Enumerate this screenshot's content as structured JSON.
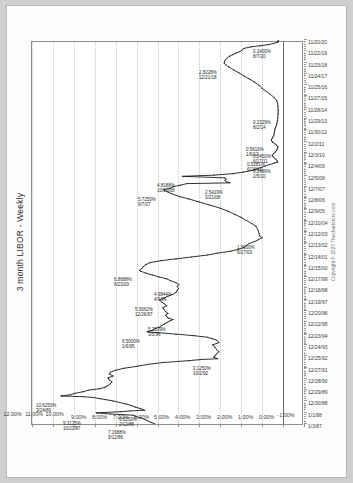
{
  "document": {
    "background_color": "#cfcfcf",
    "sheet_color": "#fdfdfd"
  },
  "chart_data": {
    "type": "line",
    "title": "3 month LIBOR - Weekly",
    "xlabel": "",
    "ylabel": "",
    "ylim": [
      -1.0,
      12.0
    ],
    "y_tick_step": 1.0,
    "grid": true,
    "legend": "none",
    "rotation_degrees": -90,
    "line_color": "#1a1a1a",
    "ytick_labels": [
      "12.00%",
      "11.00%",
      "10.00%",
      "9.00%",
      "8.00%",
      "7.00%",
      "6.00%",
      "5.00%",
      "4.00%",
      "3.00%",
      "2.00%",
      "1.00%",
      "0.00%",
      "-1.00%"
    ],
    "ytick_values": [
      12,
      11,
      10,
      9,
      8,
      7,
      6,
      5,
      4,
      3,
      2,
      1,
      0,
      -1
    ],
    "xtick_labels": [
      "1/3/87",
      "1/1/88",
      "12/30/88",
      "12/29/89",
      "12/28/90",
      "12/27/91",
      "12/25/92",
      "12/24/93",
      "12/23/94",
      "12/22/95",
      "12/20/96",
      "12/19/97",
      "12/18/98",
      "12/17/99",
      "12/15/00",
      "12/14/01",
      "12/13/02",
      "12/12/03",
      "12/10/04",
      "12/9/05",
      "12/8/06",
      "12/7/07",
      "12/5/08",
      "12/4/09",
      "12/3/10",
      "12/2/11",
      "11/30/12",
      "11/29/13",
      "11/28/14",
      "11/27/15",
      "11/25/16",
      "11/24/17",
      "11/23/18",
      "11/22/19",
      "11/20/20"
    ],
    "annotations": [
      {
        "date": "3/24/89",
        "value": "10.6250%",
        "x": 0.073,
        "y": 10.625
      },
      {
        "date": "10/23/87",
        "value": "9.3125%",
        "x": 0.025,
        "y": 9.3125
      },
      {
        "date": "9/12/86",
        "value": "7.1688%",
        "x": 0.003,
        "y": 7.1688
      },
      {
        "date": "2/12/88",
        "value": "6.6250%",
        "x": 0.036,
        "y": 6.625
      },
      {
        "date": "10/2/92",
        "value": "3.1250%",
        "x": 0.17,
        "y": 3.125
      },
      {
        "date": "1/6/95",
        "value": "6.5000%",
        "x": 0.24,
        "y": 6.5
      },
      {
        "date": "3/5/96",
        "value": "5.2539%",
        "x": 0.272,
        "y": 5.2539
      },
      {
        "date": "12/26/97",
        "value": "5.9062%",
        "x": 0.323,
        "y": 5.9062
      },
      {
        "date": "4/9/99",
        "value": "4.9844%",
        "x": 0.363,
        "y": 4.9844
      },
      {
        "date": "6/23/00",
        "value": "6.8688%",
        "x": 0.4,
        "y": 6.8688
      },
      {
        "date": "6/27/03",
        "value": "1.0000%",
        "x": 0.485,
        "y": 1.0
      },
      {
        "date": "9/7/07",
        "value": "5.7250%",
        "x": 0.61,
        "y": 5.725
      },
      {
        "date": "10/10/08",
        "value": "4.8188%",
        "x": 0.645,
        "y": 4.8188
      },
      {
        "date": "3/21/08",
        "value": "2.5419%",
        "x": 0.628,
        "y": 2.5419
      },
      {
        "date": "2/5/10",
        "value": "0.2486%",
        "x": 0.682,
        "y": 0.2486
      },
      {
        "date": "6/17/11",
        "value": "0.2450%",
        "x": 0.722,
        "y": 0.245
      },
      {
        "date": "1/6/12",
        "value": "0.5616%",
        "x": 0.74,
        "y": 0.5616
      },
      {
        "date": "6/18/10",
        "value": "0.5281%",
        "x": 0.7,
        "y": 0.5281
      },
      {
        "date": "8/2/14",
        "value": "0.2329%",
        "x": 0.81,
        "y": 0.2329
      },
      {
        "date": "12/21/18",
        "value": "2.8228%",
        "x": 0.94,
        "y": 2.8228
      },
      {
        "date": "8/7/20",
        "value": "0.2400%",
        "x": 0.995,
        "y": 0.24
      }
    ],
    "series": [
      {
        "name": "3 month LIBOR",
        "points": [
          [
            0.0,
            6.12
          ],
          [
            0.004,
            6.31
          ],
          [
            0.009,
            6.5
          ],
          [
            0.012,
            6.62
          ],
          [
            0.016,
            6.81
          ],
          [
            0.02,
            7.06
          ],
          [
            0.023,
            7.17
          ],
          [
            0.026,
            8.25
          ],
          [
            0.029,
            8.93
          ],
          [
            0.032,
            7.75
          ],
          [
            0.034,
            7.31
          ],
          [
            0.036,
            6.62
          ],
          [
            0.04,
            6.81
          ],
          [
            0.044,
            7.06
          ],
          [
            0.048,
            7.25
          ],
          [
            0.052,
            7.5
          ],
          [
            0.056,
            7.81
          ],
          [
            0.06,
            8.12
          ],
          [
            0.063,
            8.43
          ],
          [
            0.066,
            8.75
          ],
          [
            0.069,
            9.06
          ],
          [
            0.071,
            9.5
          ],
          [
            0.073,
            10.62
          ],
          [
            0.076,
            10.18
          ],
          [
            0.08,
            9.93
          ],
          [
            0.084,
            9.56
          ],
          [
            0.088,
            9.31
          ],
          [
            0.092,
            8.75
          ],
          [
            0.096,
            8.5
          ],
          [
            0.1,
            8.37
          ],
          [
            0.105,
            8.25
          ],
          [
            0.11,
            8.18
          ],
          [
            0.115,
            8.31
          ],
          [
            0.12,
            8.37
          ],
          [
            0.125,
            8.12
          ],
          [
            0.13,
            8.31
          ],
          [
            0.135,
            8.25
          ],
          [
            0.14,
            8.0
          ],
          [
            0.145,
            7.62
          ],
          [
            0.15,
            7.0
          ],
          [
            0.155,
            6.5
          ],
          [
            0.16,
            5.75
          ],
          [
            0.165,
            4.5
          ],
          [
            0.168,
            3.9
          ],
          [
            0.17,
            3.12
          ],
          [
            0.174,
            3.31
          ],
          [
            0.178,
            3.25
          ],
          [
            0.183,
            3.18
          ],
          [
            0.188,
            3.06
          ],
          [
            0.194,
            3.18
          ],
          [
            0.2,
            3.25
          ],
          [
            0.206,
            3.37
          ],
          [
            0.212,
            3.06
          ],
          [
            0.218,
            3.18
          ],
          [
            0.222,
            3.37
          ],
          [
            0.226,
            3.62
          ],
          [
            0.23,
            4.25
          ],
          [
            0.234,
            5.12
          ],
          [
            0.238,
            6.0
          ],
          [
            0.24,
            6.5
          ],
          [
            0.244,
            6.25
          ],
          [
            0.248,
            6.12
          ],
          [
            0.252,
            5.93
          ],
          [
            0.256,
            5.81
          ],
          [
            0.26,
            5.68
          ],
          [
            0.264,
            5.56
          ],
          [
            0.268,
            5.43
          ],
          [
            0.272,
            5.25
          ],
          [
            0.276,
            5.5
          ],
          [
            0.28,
            5.56
          ],
          [
            0.284,
            5.62
          ],
          [
            0.288,
            5.5
          ],
          [
            0.293,
            5.62
          ],
          [
            0.298,
            5.68
          ],
          [
            0.303,
            5.75
          ],
          [
            0.308,
            5.56
          ],
          [
            0.313,
            5.68
          ],
          [
            0.318,
            5.81
          ],
          [
            0.323,
            5.9
          ],
          [
            0.328,
            5.68
          ],
          [
            0.333,
            5.5
          ],
          [
            0.338,
            5.25
          ],
          [
            0.343,
            5.12
          ],
          [
            0.348,
            5.06
          ],
          [
            0.353,
            5.0
          ],
          [
            0.358,
            5.06
          ],
          [
            0.363,
            4.98
          ],
          [
            0.368,
            5.12
          ],
          [
            0.373,
            5.37
          ],
          [
            0.378,
            5.56
          ],
          [
            0.383,
            5.93
          ],
          [
            0.388,
            6.25
          ],
          [
            0.393,
            6.56
          ],
          [
            0.398,
            6.81
          ],
          [
            0.4,
            6.87
          ],
          [
            0.405,
            6.75
          ],
          [
            0.41,
            6.68
          ],
          [
            0.415,
            6.56
          ],
          [
            0.42,
            6.37
          ],
          [
            0.425,
            5.87
          ],
          [
            0.43,
            5.12
          ],
          [
            0.435,
            4.37
          ],
          [
            0.44,
            3.62
          ],
          [
            0.445,
            3.12
          ],
          [
            0.45,
            2.5
          ],
          [
            0.455,
            2.12
          ],
          [
            0.46,
            1.87
          ],
          [
            0.465,
            1.75
          ],
          [
            0.47,
            1.62
          ],
          [
            0.475,
            1.37
          ],
          [
            0.48,
            1.18
          ],
          [
            0.485,
            1.0
          ],
          [
            0.49,
            1.12
          ],
          [
            0.496,
            1.15
          ],
          [
            0.502,
            1.18
          ],
          [
            0.508,
            1.22
          ],
          [
            0.515,
            1.3
          ],
          [
            0.522,
            1.5
          ],
          [
            0.53,
            1.75
          ],
          [
            0.538,
            2.0
          ],
          [
            0.546,
            2.31
          ],
          [
            0.554,
            2.62
          ],
          [
            0.562,
            3.0
          ],
          [
            0.57,
            3.5
          ],
          [
            0.578,
            4.0
          ],
          [
            0.586,
            4.5
          ],
          [
            0.592,
            4.93
          ],
          [
            0.598,
            5.25
          ],
          [
            0.604,
            5.5
          ],
          [
            0.61,
            5.72
          ],
          [
            0.614,
            5.4
          ],
          [
            0.618,
            5.25
          ],
          [
            0.622,
            4.9
          ],
          [
            0.626,
            4.6
          ],
          [
            0.628,
            2.54
          ],
          [
            0.631,
            2.7
          ],
          [
            0.634,
            2.78
          ],
          [
            0.638,
            2.72
          ],
          [
            0.641,
            2.8
          ],
          [
            0.645,
            4.81
          ],
          [
            0.648,
            3.3
          ],
          [
            0.652,
            2.4
          ],
          [
            0.656,
            1.9
          ],
          [
            0.66,
            1.5
          ],
          [
            0.664,
            1.25
          ],
          [
            0.668,
            1.05
          ],
          [
            0.672,
            0.85
          ],
          [
            0.676,
            0.6
          ],
          [
            0.68,
            0.4
          ],
          [
            0.682,
            0.25
          ],
          [
            0.686,
            0.3
          ],
          [
            0.69,
            0.35
          ],
          [
            0.694,
            0.45
          ],
          [
            0.698,
            0.5
          ],
          [
            0.7,
            0.53
          ],
          [
            0.704,
            0.45
          ],
          [
            0.708,
            0.38
          ],
          [
            0.712,
            0.32
          ],
          [
            0.716,
            0.28
          ],
          [
            0.72,
            0.26
          ],
          [
            0.722,
            0.245
          ],
          [
            0.726,
            0.3
          ],
          [
            0.73,
            0.4
          ],
          [
            0.734,
            0.5
          ],
          [
            0.738,
            0.55
          ],
          [
            0.74,
            0.56
          ],
          [
            0.744,
            0.52
          ],
          [
            0.748,
            0.48
          ],
          [
            0.752,
            0.44
          ],
          [
            0.758,
            0.42
          ],
          [
            0.764,
            0.4
          ],
          [
            0.77,
            0.38
          ],
          [
            0.776,
            0.33
          ],
          [
            0.782,
            0.3
          ],
          [
            0.79,
            0.27
          ],
          [
            0.798,
            0.25
          ],
          [
            0.806,
            0.24
          ],
          [
            0.81,
            0.233
          ],
          [
            0.818,
            0.24
          ],
          [
            0.826,
            0.24
          ],
          [
            0.834,
            0.26
          ],
          [
            0.842,
            0.3
          ],
          [
            0.85,
            0.42
          ],
          [
            0.858,
            0.6
          ],
          [
            0.866,
            0.8
          ],
          [
            0.874,
            1.0
          ],
          [
            0.882,
            1.15
          ],
          [
            0.89,
            1.35
          ],
          [
            0.898,
            1.6
          ],
          [
            0.906,
            1.85
          ],
          [
            0.914,
            2.1
          ],
          [
            0.922,
            2.35
          ],
          [
            0.93,
            2.6
          ],
          [
            0.936,
            2.75
          ],
          [
            0.94,
            2.82
          ],
          [
            0.946,
            2.78
          ],
          [
            0.952,
            2.7
          ],
          [
            0.958,
            2.55
          ],
          [
            0.962,
            2.4
          ],
          [
            0.966,
            2.25
          ],
          [
            0.97,
            2.05
          ],
          [
            0.974,
            1.95
          ],
          [
            0.978,
            1.88
          ],
          [
            0.982,
            1.55
          ],
          [
            0.985,
            1.1
          ],
          [
            0.988,
            0.7
          ],
          [
            0.991,
            0.45
          ],
          [
            0.994,
            0.28
          ],
          [
            0.995,
            0.24
          ],
          [
            0.998,
            0.23
          ],
          [
            1.0,
            0.22
          ]
        ]
      }
    ]
  },
  "copyright": "Copyright © 2020 Thechartstore.com"
}
